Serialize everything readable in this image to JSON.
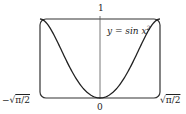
{
  "chart_data": {
    "type": "line",
    "title": "",
    "function": "y = sin x^2",
    "series": [
      {
        "name": "y = sin x²",
        "x": [
          -1.2533,
          -1.0,
          -0.75,
          -0.5,
          -0.25,
          0,
          0.25,
          0.5,
          0.75,
          1.0,
          1.2533
        ],
        "values": [
          1.0,
          0.8415,
          0.5333,
          0.2474,
          0.0625,
          0,
          0.0625,
          0.2474,
          0.5333,
          0.8415,
          1.0
        ]
      }
    ],
    "xlim": [
      -1.2533,
      1.2533
    ],
    "ylim": [
      0,
      1
    ],
    "x_tick_labels": [
      "-√π/2",
      "0",
      "√π/2"
    ],
    "y_tick_labels": [
      "1"
    ],
    "xlabel": "",
    "ylabel": "",
    "annotation": "y = sin x²",
    "grid": false
  },
  "labels": {
    "y_top": "1",
    "x_left": "−√π/2",
    "x_zero": "0",
    "x_right": "√π/2",
    "curve": "y = sin x"
  }
}
